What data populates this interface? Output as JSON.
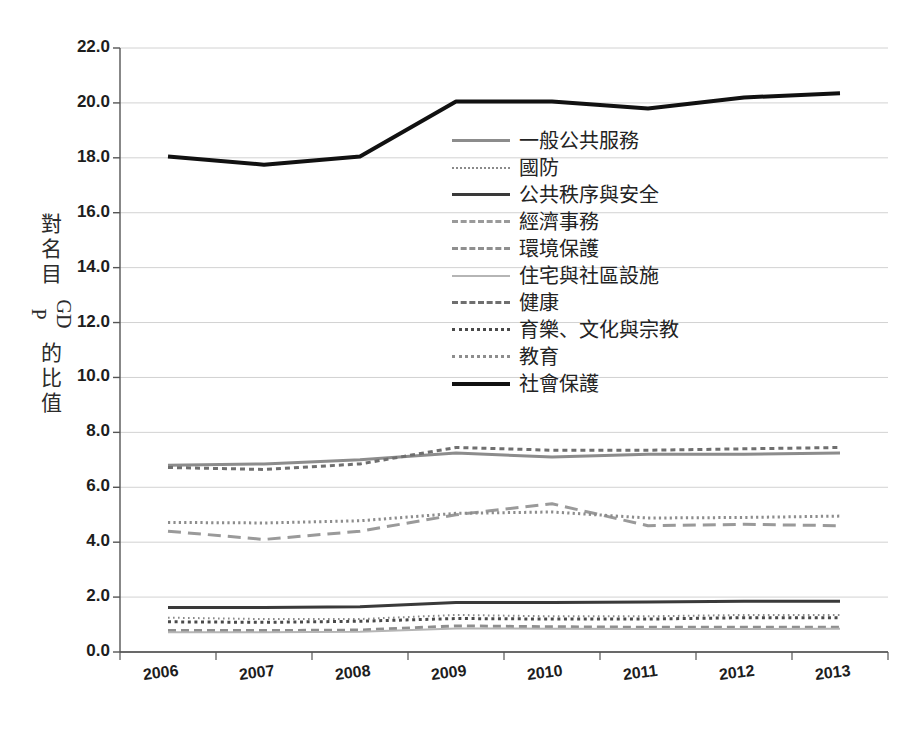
{
  "chart_data": {
    "type": "line",
    "title": "",
    "xlabel": "",
    "ylabel": "對名目GDP的比值",
    "categories": [
      "2006",
      "2007",
      "2008",
      "2009",
      "2010",
      "2011",
      "2012",
      "2013"
    ],
    "x": [
      2006,
      2007,
      2008,
      2009,
      2010,
      2011,
      2012,
      2013
    ],
    "ylim": [
      0.0,
      22.0
    ],
    "ytick_labels": [
      "0.0",
      "2.0",
      "4.0",
      "6.0",
      "8.0",
      "10.0",
      "12.0",
      "14.0",
      "16.0",
      "18.0",
      "20.0",
      "22.0"
    ],
    "ytick_values": [
      0,
      2,
      4,
      6,
      8,
      10,
      12,
      14,
      16,
      18,
      20,
      22
    ],
    "grid": true,
    "legend_position": "center",
    "series": [
      {
        "name": "一般公共服務",
        "style": "solid",
        "color": "#8c8c8c",
        "width": 3,
        "values": [
          6.8,
          6.85,
          7.0,
          7.25,
          7.1,
          7.2,
          7.2,
          7.25
        ]
      },
      {
        "name": "國防",
        "style": "fine-dotted",
        "color": "#8a8a8a",
        "width": 2,
        "values": [
          1.25,
          1.2,
          1.2,
          1.35,
          1.3,
          1.3,
          1.35,
          1.35
        ]
      },
      {
        "name": "公共秩序與安全",
        "style": "solid",
        "color": "#3a3a3a",
        "width": 3,
        "values": [
          1.62,
          1.62,
          1.65,
          1.8,
          1.8,
          1.82,
          1.85,
          1.85
        ]
      },
      {
        "name": "經濟事務",
        "style": "long-dashed",
        "color": "#9a9a9a",
        "width": 3,
        "values": [
          4.4,
          4.1,
          4.4,
          5.0,
          5.4,
          4.6,
          4.65,
          4.6
        ]
      },
      {
        "name": "環境保護",
        "style": "dashed",
        "color": "#8f8f8f",
        "width": 3,
        "values": [
          0.78,
          0.78,
          0.8,
          0.95,
          0.92,
          0.9,
          0.9,
          0.9
        ]
      },
      {
        "name": "住宅與社區設施",
        "style": "solid",
        "color": "#b5b5b5",
        "width": 2,
        "values": [
          0.72,
          0.72,
          0.74,
          0.86,
          0.85,
          0.84,
          0.84,
          0.85
        ]
      },
      {
        "name": "健康",
        "style": "square-dashed",
        "color": "#6f6f6f",
        "width": 3,
        "values": [
          6.72,
          6.65,
          6.85,
          7.45,
          7.35,
          7.35,
          7.4,
          7.45
        ]
      },
      {
        "name": "育樂、文化與宗教",
        "style": "bold-dotted",
        "color": "#4a4a4a",
        "width": 3,
        "values": [
          1.1,
          1.08,
          1.12,
          1.22,
          1.2,
          1.2,
          1.25,
          1.25
        ]
      },
      {
        "name": "教育",
        "style": "small-dotted",
        "color": "#8d8d8d",
        "width": 3,
        "values": [
          4.72,
          4.7,
          4.78,
          5.05,
          5.1,
          4.88,
          4.9,
          4.95
        ]
      },
      {
        "name": "社會保護",
        "style": "solid",
        "color": "#111111",
        "width": 4,
        "values": [
          18.05,
          17.75,
          18.05,
          20.05,
          20.05,
          19.8,
          20.2,
          20.35
        ]
      }
    ]
  },
  "legend": {
    "items": [
      {
        "label": "一般公共服務"
      },
      {
        "label": "國防"
      },
      {
        "label": "公共秩序與安全"
      },
      {
        "label": "經濟事務"
      },
      {
        "label": "環境保護"
      },
      {
        "label": "住宅與社區設施"
      },
      {
        "label": "健康"
      },
      {
        "label": "育樂、文化與宗教"
      },
      {
        "label": "教育"
      },
      {
        "label": "社會保護"
      }
    ]
  },
  "axis": {
    "y_title_chars": [
      "對",
      "名",
      "目",
      "GDP",
      "的",
      "比",
      "值"
    ]
  }
}
